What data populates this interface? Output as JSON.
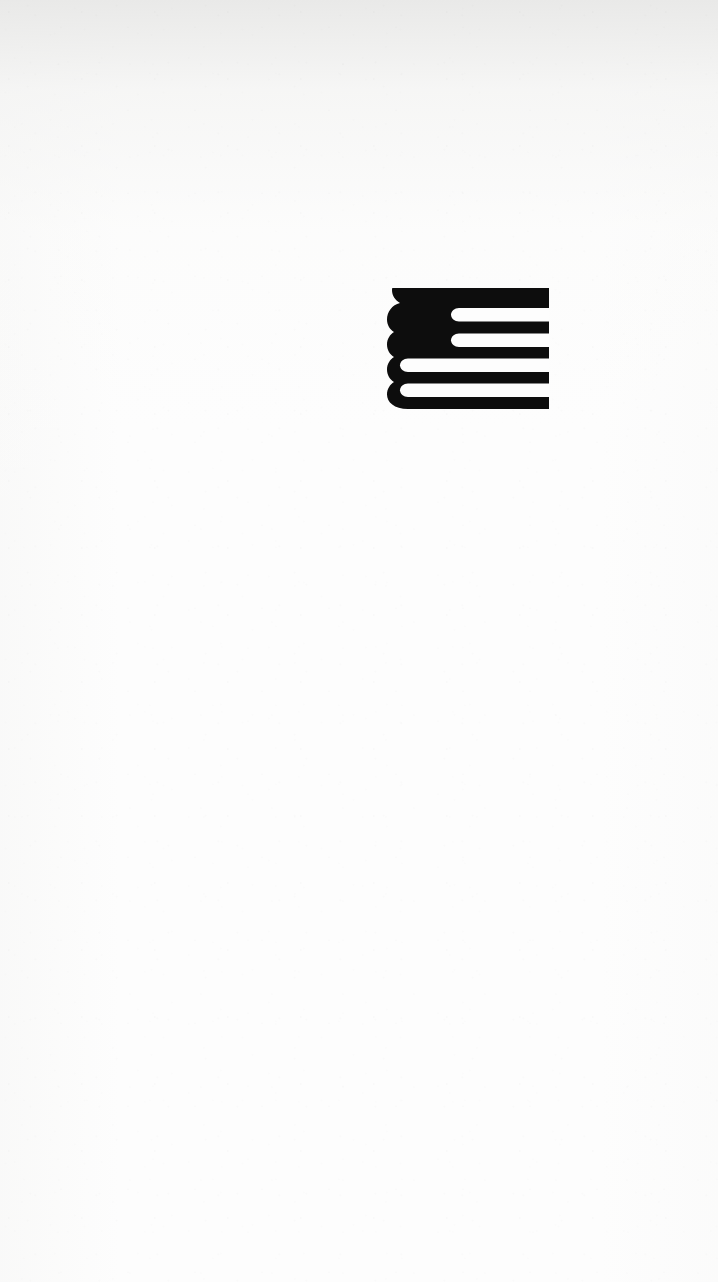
{
  "page": {
    "kind": "scanned-book-page",
    "content_text": "",
    "background_color": "#fdfdfd",
    "ink_color": "#0d0d0d",
    "width": 718,
    "height": 1282
  },
  "colophon": {
    "icon_name": "publisher-colophon-flag-book-mark",
    "label": "",
    "color": "#0d0d0d",
    "position": {
      "x": 386,
      "y": 288,
      "width": 163,
      "height": 121
    },
    "description": "Stylized book/flag device: scalloped four-bump spine at left, solid black canton upper-left, five black horizontal bars flush to the right edge separated by four white stripes",
    "spine_bumps": 4,
    "black_bars": 5,
    "white_stripes": 4
  }
}
